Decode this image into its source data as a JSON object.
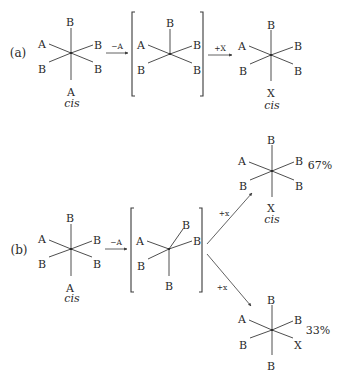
{
  "colors": {
    "ink": "#2a2a2a",
    "background": "#ffffff"
  },
  "parts": [
    {
      "id": "a",
      "label": "(a)",
      "label_pos": [
        18,
        57
      ],
      "reactant": {
        "center": [
          71,
          53
        ],
        "isomer": "cis",
        "isomer_pos": [
          72,
          107
        ],
        "ligands": [
          {
            "label": "B",
            "pos": [
              70,
              22
            ],
            "bond_end": [
              71,
              28
            ]
          },
          {
            "label": "A",
            "pos": [
              42,
              44
            ],
            "bond_end": [
              49,
              44
            ]
          },
          {
            "label": "B",
            "pos": [
              98,
              45
            ],
            "bond_end": [
              93,
              45
            ]
          },
          {
            "label": "B",
            "pos": [
              42,
              69
            ],
            "bond_end": [
              49,
              62
            ]
          },
          {
            "label": "B",
            "pos": [
              98,
              69
            ],
            "bond_end": [
              93,
              62
            ]
          },
          {
            "label": "A",
            "pos": [
              71,
              92
            ],
            "bond_end": [
              71,
              80
            ]
          }
        ]
      },
      "step1": {
        "label": "−A",
        "from": [
          106,
          53
        ],
        "to": [
          128,
          53
        ],
        "label_pos": [
          117,
          49
        ]
      },
      "intermediate": {
        "bracket_left": {
          "x": 132,
          "y1": 12,
          "y2": 96
        },
        "bracket_right": {
          "x": 203,
          "y1": 12,
          "y2": 96
        },
        "center": [
          170,
          54
        ],
        "ligands": [
          {
            "label": "B",
            "pos": [
              170,
              23
            ],
            "bond_end": [
              170,
              29
            ]
          },
          {
            "label": "A",
            "pos": [
              141,
              45
            ],
            "bond_end": [
              148,
              45
            ]
          },
          {
            "label": "B",
            "pos": [
              197,
              45
            ],
            "bond_end": [
              192,
              46
            ]
          },
          {
            "label": "B",
            "pos": [
              141,
              70
            ],
            "bond_end": [
              148,
              63
            ]
          },
          {
            "label": "B",
            "pos": [
              197,
              70
            ],
            "bond_end": [
              192,
              63
            ]
          }
        ]
      },
      "step2": {
        "label": "+X",
        "from": [
          208,
          55
        ],
        "to": [
          232,
          55
        ],
        "label_pos": [
          220,
          51
        ]
      },
      "products": [
        {
          "center": [
            271,
            55
          ],
          "isomer": "cis",
          "isomer_pos": [
            272,
            109
          ],
          "yield": "",
          "ligands": [
            {
              "label": "B",
              "pos": [
                271,
                25
              ],
              "bond_end": [
                271,
                30
              ]
            },
            {
              "label": "A",
              "pos": [
                242,
                46
              ],
              "bond_end": [
                249,
                46
              ]
            },
            {
              "label": "B",
              "pos": [
                298,
                46
              ],
              "bond_end": [
                293,
                47
              ]
            },
            {
              "label": "B",
              "pos": [
                243,
                71
              ],
              "bond_end": [
                250,
                64
              ]
            },
            {
              "label": "B",
              "pos": [
                298,
                71
              ],
              "bond_end": [
                293,
                64
              ]
            },
            {
              "label": "X",
              "pos": [
                271,
                93
              ],
              "bond_end": [
                271,
                81
              ]
            }
          ]
        }
      ]
    },
    {
      "id": "b",
      "label": "(b)",
      "label_pos": [
        19,
        254
      ],
      "reactant": {
        "center": [
          71,
          249
        ],
        "isomer": "cis",
        "isomer_pos": [
          72,
          302
        ],
        "ligands": [
          {
            "label": "B",
            "pos": [
              70,
              218
            ],
            "bond_end": [
              71,
              224
            ]
          },
          {
            "label": "A",
            "pos": [
              42,
              239
            ],
            "bond_end": [
              49,
              240
            ]
          },
          {
            "label": "B",
            "pos": [
              97,
              240
            ],
            "bond_end": [
              92,
              241
            ]
          },
          {
            "label": "B",
            "pos": [
              42,
              264
            ],
            "bond_end": [
              49,
              257
            ]
          },
          {
            "label": "B",
            "pos": [
              97,
              264
            ],
            "bond_end": [
              92,
              257
            ]
          },
          {
            "label": "A",
            "pos": [
              70,
              288
            ],
            "bond_end": [
              71,
              276
            ]
          }
        ]
      },
      "step1": {
        "label": "−A",
        "from": [
          105,
          249
        ],
        "to": [
          127,
          249
        ],
        "label_pos": [
          116,
          245
        ]
      },
      "intermediate": {
        "bracket_left": {
          "x": 131,
          "y1": 208,
          "y2": 292
        },
        "bracket_right": {
          "x": 202,
          "y1": 208,
          "y2": 292
        },
        "center": [
          169,
          249
        ],
        "ligands": [
          {
            "label": "B",
            "pos": [
              186,
              225
            ],
            "bond_end": [
              183,
              229
            ]
          },
          {
            "label": "A",
            "pos": [
              140,
              241
            ],
            "bond_end": [
              147,
              241
            ]
          },
          {
            "label": "B",
            "pos": [
              197,
              241
            ],
            "bond_end": [
              192,
              241
            ]
          },
          {
            "label": "B",
            "pos": [
              141,
              266
            ],
            "bond_end": [
              148,
              259
            ]
          },
          {
            "label": "B",
            "pos": [
              169,
              286
            ],
            "bond_end": [
              169,
              276
            ]
          }
        ]
      },
      "branches": [
        {
          "label": "+x",
          "from": [
            207,
            244
          ],
          "to": [
            252,
            193
          ],
          "label_pos": [
            224,
            216
          ]
        },
        {
          "label": "+x",
          "from": [
            207,
            254
          ],
          "to": [
            251,
            306
          ],
          "label_pos": [
            222,
            290
          ]
        }
      ],
      "products": [
        {
          "center": [
            272,
            171
          ],
          "isomer": "cis",
          "isomer_pos": [
            272,
            223
          ],
          "yield": "67%",
          "yield_pos": [
            320,
            169
          ],
          "ligands": [
            {
              "label": "B",
              "pos": [
                271,
                140
              ],
              "bond_end": [
                272,
                145
              ]
            },
            {
              "label": "A",
              "pos": [
                242,
                161
              ],
              "bond_end": [
                249,
                162
              ]
            },
            {
              "label": "B",
              "pos": [
                299,
                161
              ],
              "bond_end": [
                294,
                162
              ]
            },
            {
              "label": "B",
              "pos": [
                243,
                186
              ],
              "bond_end": [
                250,
                180
              ]
            },
            {
              "label": "B",
              "pos": [
                299,
                186
              ],
              "bond_end": [
                294,
                180
              ]
            },
            {
              "label": "X",
              "pos": [
                271,
                208
              ],
              "bond_end": [
                272,
                197
              ]
            }
          ]
        },
        {
          "center": [
            272,
            330
          ],
          "isomer": "",
          "yield": "33%",
          "yield_pos": [
            318,
            334
          ],
          "ligands": [
            {
              "label": "B",
              "pos": [
                271,
                300
              ],
              "bond_end": [
                272,
                305
              ]
            },
            {
              "label": "A",
              "pos": [
                242,
                319
              ],
              "bond_end": [
                249,
                320
              ]
            },
            {
              "label": "B",
              "pos": [
                298,
                320
              ],
              "bond_end": [
                293,
                321
              ]
            },
            {
              "label": "B",
              "pos": [
                243,
                345
              ],
              "bond_end": [
                250,
                338
              ]
            },
            {
              "label": "X",
              "pos": [
                298,
                345
              ],
              "bond_end": [
                293,
                338
              ]
            },
            {
              "label": "B",
              "pos": [
                271,
                366
              ],
              "bond_end": [
                272,
                355
              ]
            }
          ]
        }
      ]
    }
  ]
}
